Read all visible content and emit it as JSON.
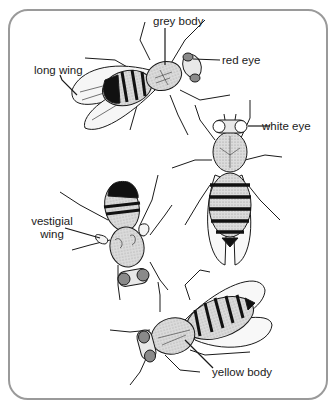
{
  "diagram": {
    "type": "labeled-illustration",
    "colors": {
      "border": "#9a9a9a",
      "outline": "#1a1a1a",
      "grey_body": "#d8d8d8",
      "yellow_body": "#d0d0d0",
      "red_eye": "#8a8a8a",
      "white_eye": "#ffffff",
      "dark_band": "#111111"
    },
    "labels": {
      "grey_body": "grey body",
      "red_eye": "red eye",
      "long_wing": "long wing",
      "white_eye": "white eye",
      "vestigial_wing_line1": "vestigial",
      "vestigial_wing_line2": "wing",
      "yellow_body": "yellow body"
    },
    "flies": [
      {
        "id": "fly-1",
        "position": "top",
        "traits": [
          "grey body",
          "red eye",
          "long wing"
        ]
      },
      {
        "id": "fly-2",
        "position": "right",
        "traits": [
          "white eye"
        ]
      },
      {
        "id": "fly-3",
        "position": "left-middle",
        "traits": [
          "vestigial wing"
        ]
      },
      {
        "id": "fly-4",
        "position": "bottom",
        "traits": [
          "yellow body"
        ]
      }
    ]
  }
}
